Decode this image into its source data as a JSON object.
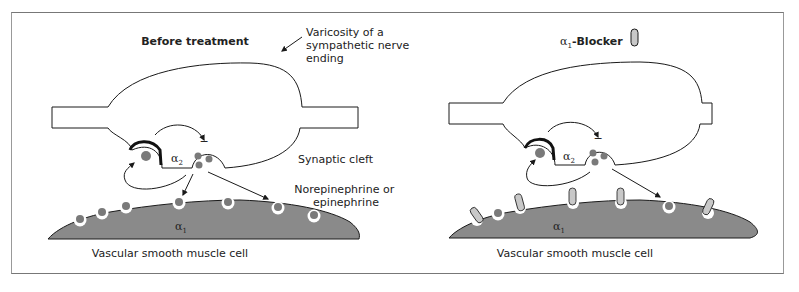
{
  "panels": [
    {
      "id": "before",
      "title": "Before treatment",
      "callouts": {
        "varicosity": [
          "Varicosity of a",
          "sympathetic nerve",
          "ending"
        ],
        "synaptic_cleft": "Synaptic cleft",
        "transmitter": [
          "Norepinephrine or",
          "epinephrine"
        ]
      },
      "presynaptic_receptor": {
        "symbol": "α",
        "subscript": "2"
      },
      "postsynaptic_receptor": {
        "symbol": "α",
        "subscript": "1"
      },
      "cell_label": "Vascular smooth muscle cell",
      "receptor_sites": [
        "transmitter",
        "transmitter",
        "transmitter",
        "transmitter",
        "transmitter",
        "transmitter",
        "transmitter"
      ]
    },
    {
      "id": "after",
      "title_symbol": "α",
      "title_subscript": "1",
      "title": "-Blocker",
      "presynaptic_receptor": {
        "symbol": "α",
        "subscript": "2"
      },
      "postsynaptic_receptor": {
        "symbol": "α",
        "subscript": "1"
      },
      "cell_label": "Vascular smooth muscle cell",
      "receptor_sites": [
        "blocker",
        "transmitter",
        "blocker",
        "blocker",
        "blocker",
        "transmitter",
        "blocker"
      ]
    }
  ],
  "colors": {
    "cell_fill": "#8a8a8a",
    "vesicle_fill": "#7a7a7a",
    "blocker_fill": "#c8c8c8",
    "line": "#1a1a1a",
    "frame": "#888888"
  },
  "inhibition_sign": "−"
}
